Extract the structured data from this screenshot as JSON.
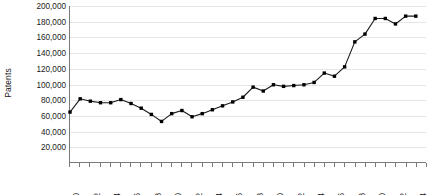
{
  "chart_data": {
    "type": "line",
    "title": "",
    "xlabel": "",
    "ylabel": "Patents",
    "ylim": [
      0,
      200000
    ],
    "xlim": [
      1970,
      2005
    ],
    "grid": true,
    "legend": false,
    "marker": "filled-square",
    "line_color": "#1a1a1a",
    "marker_color": "#000000",
    "grid_color": "#e6e6e6",
    "axis_color": "#7a7a7a",
    "y_ticks": [
      20000,
      40000,
      60000,
      80000,
      100000,
      120000,
      140000,
      160000,
      180000,
      200000
    ],
    "y_tick_labels": [
      "20,000",
      "40,000",
      "60,000",
      "80,000",
      "100,000",
      "120,000",
      "140,000",
      "160,000",
      "180,000",
      "200,000"
    ],
    "x_ticks": [
      1970,
      1971,
      1972,
      1973,
      1974,
      1975,
      1976,
      1977,
      1978,
      1979,
      1980,
      1981,
      1982,
      1983,
      1984,
      1985,
      1986,
      1987,
      1988,
      1989,
      1990,
      1991,
      1992,
      1993,
      1994,
      1995,
      1996,
      1997,
      1998,
      1999,
      2000,
      2001,
      2002,
      2003,
      2004,
      2005
    ],
    "x_tick_labels": [
      "1970",
      "1972",
      "1974",
      "1976",
      "1978",
      "1980",
      "1982",
      "1984",
      "1986",
      "1988",
      "1990",
      "1992",
      "1994",
      "1996",
      "1998",
      "2000",
      "2002",
      "2004"
    ],
    "x_tick_label_years": [
      1970,
      1972,
      1974,
      1976,
      1978,
      1980,
      1982,
      1984,
      1986,
      1988,
      1990,
      1992,
      1994,
      1996,
      1998,
      2000,
      2002,
      2004
    ],
    "x": [
      1970,
      1971,
      1972,
      1973,
      1974,
      1975,
      1976,
      1977,
      1978,
      1979,
      1980,
      1981,
      1982,
      1983,
      1984,
      1985,
      1986,
      1987,
      1988,
      1989,
      1990,
      1991,
      1992,
      1993,
      1994,
      1995,
      1996,
      1997,
      1998,
      1999,
      2000,
      2001,
      2002,
      2003,
      2004
    ],
    "values": [
      64000,
      81000,
      78000,
      76000,
      76000,
      80000,
      75000,
      69000,
      61000,
      52000,
      62000,
      66000,
      58000,
      62000,
      67000,
      72000,
      77000,
      83000,
      96000,
      91000,
      99000,
      97000,
      98000,
      99000,
      102000,
      114000,
      110000,
      122000,
      154000,
      164000,
      184000,
      184000,
      177000,
      187000,
      187000
    ],
    "data_labels": [
      {
        "year": 1970,
        "value": 64000
      },
      {
        "year": 1971,
        "value": 81000
      },
      {
        "year": 1972,
        "value": 78000
      },
      {
        "year": 1973,
        "value": 76000
      },
      {
        "year": 1974,
        "value": 76000
      },
      {
        "year": 1975,
        "value": 80000
      },
      {
        "year": 1976,
        "value": 75000
      },
      {
        "year": 1977,
        "value": 69000
      },
      {
        "year": 1978,
        "value": 61000
      },
      {
        "year": 1979,
        "value": 52000
      },
      {
        "year": 1980,
        "value": 62000
      },
      {
        "year": 1981,
        "value": 66000
      },
      {
        "year": 1982,
        "value": 58000
      },
      {
        "year": 1983,
        "value": 62000
      },
      {
        "year": 1984,
        "value": 67000
      },
      {
        "year": 1985,
        "value": 72000
      },
      {
        "year": 1986,
        "value": 77000
      },
      {
        "year": 1987,
        "value": 83000
      },
      {
        "year": 1988,
        "value": 96000
      },
      {
        "year": 1989,
        "value": 91000
      },
      {
        "year": 1990,
        "value": 99000
      },
      {
        "year": 1991,
        "value": 97000
      },
      {
        "year": 1992,
        "value": 98000
      },
      {
        "year": 1993,
        "value": 99000
      },
      {
        "year": 1994,
        "value": 102000
      },
      {
        "year": 1995,
        "value": 114000
      },
      {
        "year": 1996,
        "value": 110000
      },
      {
        "year": 1997,
        "value": 122000
      },
      {
        "year": 1998,
        "value": 154000
      },
      {
        "year": 1999,
        "value": 164000
      },
      {
        "year": 2000,
        "value": 184000
      },
      {
        "year": 2001,
        "value": 184000
      },
      {
        "year": 2002,
        "value": 177000
      },
      {
        "year": 2003,
        "value": 187000
      },
      {
        "year": 2004,
        "value": 187000
      }
    ]
  }
}
